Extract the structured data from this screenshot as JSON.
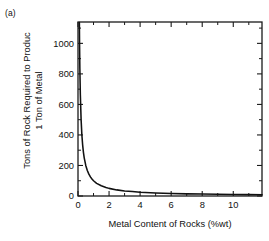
{
  "panel": {
    "label": "(a)"
  },
  "chart_data": {
    "type": "line",
    "title": "",
    "subtitle": "",
    "xlabel": "Metal Content of Rocks (%wt)",
    "ylabel": "Tons of Rock Required to Produc\n1 Ton of Metal",
    "ylabel_line1": "Tons of Rock Required to Produc",
    "ylabel_line2": "1 Ton of Metal",
    "xlim": [
      0,
      11.85
    ],
    "ylim": [
      0,
      1140
    ],
    "xticks": [
      0,
      2,
      4,
      6,
      8,
      10
    ],
    "xtick_labels": [
      "0",
      "2",
      "4",
      "6",
      "8",
      "10"
    ],
    "x_minor_ticks": [
      1,
      3,
      5,
      7,
      9,
      11
    ],
    "yticks": [
      0,
      200,
      400,
      600,
      800,
      1000
    ],
    "ytick_labels": [
      "0",
      "200",
      "400",
      "600",
      "800",
      "1000"
    ],
    "y_minor_ticks": [
      100,
      300,
      500,
      700,
      900,
      1100
    ],
    "grid": false,
    "legend": "none",
    "series": [
      {
        "name": "Tons of rock per ton of metal",
        "relation": "y = 100 / x",
        "x": [
          0.088,
          0.1,
          0.12,
          0.15,
          0.2,
          0.25,
          0.3,
          0.35,
          0.4,
          0.5,
          0.6,
          0.7,
          0.8,
          0.9,
          1.0,
          1.2,
          1.5,
          1.8,
          2.0,
          2.5,
          3.0,
          3.5,
          4.0,
          5.0,
          6.0,
          7.0,
          8.0,
          9.0,
          10.0,
          11.0,
          11.85
        ],
        "values": [
          1136,
          1000,
          833,
          667,
          500,
          400,
          333,
          286,
          250,
          200,
          167,
          143,
          125,
          111,
          100,
          83,
          67,
          56,
          50,
          40,
          33,
          29,
          25,
          20,
          17,
          14,
          13,
          11,
          10,
          9,
          8
        ]
      }
    ]
  },
  "axes": {
    "line_color": "#1a1a1a",
    "curve_color": "#111111"
  }
}
